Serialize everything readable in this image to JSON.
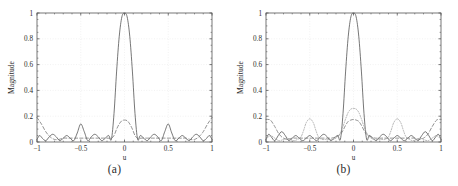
{
  "figure": {
    "panels": [
      {
        "id": "a",
        "caption": "(a)",
        "xlabel": "u",
        "ylabel": "Magnitude",
        "xticks": [
          "−1",
          "−0.5",
          "0",
          "0.5",
          "1"
        ],
        "yticks": [
          "0",
          "0.2",
          "0.4",
          "0.6",
          "0.8",
          "1"
        ]
      },
      {
        "id": "b",
        "caption": "(b)",
        "xlabel": "u",
        "ylabel": "Magnitude",
        "xticks": [
          "−1",
          "−0.5",
          "0",
          "0.5",
          "1"
        ],
        "yticks": [
          "0",
          "0.2",
          "0.4",
          "0.6",
          "0.8",
          "1"
        ]
      }
    ]
  },
  "colors": {
    "axis": "#555555",
    "curve_solid": "#4a4a4a",
    "curve_dashed": "#6f6f6f",
    "curve_dotted": "#9a9a9a",
    "grid": "#ededed",
    "background": "#ffffff"
  },
  "chart_data": [
    {
      "type": "line",
      "title": "(a)",
      "xlabel": "u",
      "ylabel": "Magnitude",
      "xlim": [
        -1,
        1
      ],
      "ylim": [
        0,
        1
      ],
      "xticks": [
        -1,
        -0.5,
        0,
        0.5,
        1
      ],
      "yticks": [
        0,
        0.2,
        0.4,
        0.6,
        0.8,
        1
      ],
      "grid": true,
      "legend": "none",
      "series": [
        {
          "name": "beampattern-solid",
          "style": "solid",
          "x": [
            -1.0,
            -0.97,
            -0.94,
            -0.9,
            -0.86,
            -0.82,
            -0.78,
            -0.74,
            -0.7,
            -0.66,
            -0.62,
            -0.58,
            -0.54,
            -0.5,
            -0.46,
            -0.42,
            -0.38,
            -0.34,
            -0.3,
            -0.26,
            -0.22,
            -0.18,
            -0.15,
            -0.12,
            -0.09,
            -0.06,
            -0.03,
            0.0,
            0.03,
            0.06,
            0.09,
            0.12,
            0.15,
            0.18,
            0.22,
            0.26,
            0.3,
            0.34,
            0.38,
            0.42,
            0.46,
            0.5,
            0.54,
            0.58,
            0.62,
            0.66,
            0.7,
            0.74,
            0.78,
            0.82,
            0.86,
            0.9,
            0.94,
            0.97,
            1.0
          ],
          "y": [
            0.02,
            0.05,
            0.03,
            0.01,
            0.04,
            0.06,
            0.04,
            0.01,
            0.03,
            0.05,
            0.03,
            0.01,
            0.07,
            0.14,
            0.08,
            0.01,
            0.04,
            0.06,
            0.04,
            0.01,
            0.03,
            0.05,
            0.02,
            0.22,
            0.55,
            0.82,
            0.97,
            1.0,
            0.97,
            0.82,
            0.55,
            0.22,
            0.02,
            0.05,
            0.03,
            0.01,
            0.04,
            0.06,
            0.04,
            0.01,
            0.08,
            0.14,
            0.07,
            0.01,
            0.03,
            0.05,
            0.03,
            0.01,
            0.04,
            0.06,
            0.04,
            0.01,
            0.03,
            0.05,
            0.02
          ]
        },
        {
          "name": "beampattern-dashed",
          "style": "dashed",
          "x": [
            -1.0,
            -0.95,
            -0.9,
            -0.85,
            -0.8,
            -0.75,
            -0.7,
            -0.65,
            -0.6,
            -0.55,
            -0.5,
            -0.45,
            -0.4,
            -0.35,
            -0.3,
            -0.25,
            -0.2,
            -0.15,
            -0.12,
            -0.09,
            -0.06,
            -0.03,
            0.0,
            0.03,
            0.06,
            0.09,
            0.12,
            0.15,
            0.2,
            0.25,
            0.3,
            0.35,
            0.4,
            0.45,
            0.5,
            0.55,
            0.6,
            0.65,
            0.7,
            0.75,
            0.8,
            0.85,
            0.9,
            0.95,
            1.0
          ],
          "y": [
            0.19,
            0.14,
            0.08,
            0.04,
            0.02,
            0.02,
            0.03,
            0.03,
            0.03,
            0.03,
            0.03,
            0.03,
            0.03,
            0.03,
            0.03,
            0.03,
            0.03,
            0.03,
            0.05,
            0.1,
            0.14,
            0.165,
            0.17,
            0.165,
            0.14,
            0.1,
            0.05,
            0.03,
            0.03,
            0.03,
            0.03,
            0.03,
            0.03,
            0.03,
            0.03,
            0.03,
            0.03,
            0.03,
            0.03,
            0.02,
            0.02,
            0.04,
            0.08,
            0.14,
            0.19
          ]
        }
      ]
    },
    {
      "type": "line",
      "title": "(b)",
      "xlabel": "u",
      "ylabel": "Magnitude",
      "xlim": [
        -1,
        1
      ],
      "ylim": [
        0,
        1
      ],
      "xticks": [
        -1,
        -0.5,
        0,
        0.5,
        1
      ],
      "yticks": [
        0,
        0.2,
        0.4,
        0.6,
        0.8,
        1
      ],
      "grid": true,
      "legend": "none",
      "series": [
        {
          "name": "beampattern-solid",
          "style": "solid",
          "x": [
            -1.0,
            -0.97,
            -0.94,
            -0.9,
            -0.86,
            -0.82,
            -0.78,
            -0.74,
            -0.7,
            -0.66,
            -0.62,
            -0.58,
            -0.54,
            -0.5,
            -0.46,
            -0.42,
            -0.38,
            -0.34,
            -0.3,
            -0.26,
            -0.22,
            -0.18,
            -0.15,
            -0.12,
            -0.09,
            -0.06,
            -0.03,
            0.0,
            0.03,
            0.06,
            0.09,
            0.12,
            0.15,
            0.18,
            0.22,
            0.26,
            0.3,
            0.34,
            0.38,
            0.42,
            0.46,
            0.5,
            0.54,
            0.58,
            0.62,
            0.66,
            0.7,
            0.74,
            0.78,
            0.82,
            0.86,
            0.9,
            0.94,
            0.97,
            1.0
          ],
          "y": [
            0.02,
            0.06,
            0.04,
            0.01,
            0.05,
            0.08,
            0.05,
            0.01,
            0.03,
            0.05,
            0.03,
            0.01,
            0.03,
            0.05,
            0.03,
            0.01,
            0.04,
            0.06,
            0.04,
            0.01,
            0.03,
            0.05,
            0.02,
            0.22,
            0.55,
            0.82,
            0.97,
            1.0,
            0.97,
            0.82,
            0.55,
            0.22,
            0.02,
            0.05,
            0.03,
            0.01,
            0.04,
            0.06,
            0.04,
            0.01,
            0.03,
            0.05,
            0.03,
            0.01,
            0.03,
            0.05,
            0.03,
            0.01,
            0.05,
            0.08,
            0.05,
            0.01,
            0.04,
            0.06,
            0.02
          ]
        },
        {
          "name": "beampattern-dashed",
          "style": "dashed",
          "x": [
            -1.0,
            -0.95,
            -0.9,
            -0.85,
            -0.8,
            -0.75,
            -0.7,
            -0.65,
            -0.6,
            -0.55,
            -0.5,
            -0.45,
            -0.4,
            -0.35,
            -0.3,
            -0.25,
            -0.2,
            -0.15,
            -0.12,
            -0.09,
            -0.06,
            -0.03,
            0.0,
            0.03,
            0.06,
            0.09,
            0.12,
            0.15,
            0.2,
            0.25,
            0.3,
            0.35,
            0.4,
            0.45,
            0.5,
            0.55,
            0.6,
            0.65,
            0.7,
            0.75,
            0.8,
            0.85,
            0.9,
            0.95,
            1.0
          ],
          "y": [
            0.175,
            0.17,
            0.12,
            0.06,
            0.03,
            0.02,
            0.03,
            0.03,
            0.03,
            0.03,
            0.03,
            0.03,
            0.03,
            0.03,
            0.03,
            0.03,
            0.04,
            0.06,
            0.09,
            0.13,
            0.16,
            0.17,
            0.175,
            0.17,
            0.16,
            0.13,
            0.09,
            0.06,
            0.04,
            0.03,
            0.03,
            0.03,
            0.03,
            0.03,
            0.03,
            0.03,
            0.03,
            0.03,
            0.03,
            0.02,
            0.03,
            0.06,
            0.12,
            0.17,
            0.175
          ]
        },
        {
          "name": "beampattern-dotted",
          "style": "dotted",
          "x": [
            -1.0,
            -0.95,
            -0.9,
            -0.85,
            -0.8,
            -0.76,
            -0.72,
            -0.68,
            -0.64,
            -0.6,
            -0.57,
            -0.54,
            -0.5,
            -0.46,
            -0.43,
            -0.4,
            -0.36,
            -0.32,
            -0.28,
            -0.24,
            -0.2,
            -0.16,
            -0.12,
            -0.09,
            -0.06,
            -0.03,
            0.0,
            0.03,
            0.06,
            0.09,
            0.12,
            0.16,
            0.2,
            0.24,
            0.28,
            0.32,
            0.36,
            0.4,
            0.43,
            0.46,
            0.5,
            0.54,
            0.57,
            0.6,
            0.64,
            0.68,
            0.72,
            0.76,
            0.8,
            0.85,
            0.9,
            0.95,
            1.0
          ],
          "y": [
            0.02,
            0.05,
            0.03,
            0.01,
            0.02,
            0.03,
            0.02,
            0.01,
            0.02,
            0.04,
            0.09,
            0.15,
            0.18,
            0.15,
            0.09,
            0.04,
            0.02,
            0.02,
            0.02,
            0.02,
            0.03,
            0.06,
            0.12,
            0.18,
            0.23,
            0.255,
            0.26,
            0.255,
            0.23,
            0.18,
            0.12,
            0.06,
            0.03,
            0.02,
            0.02,
            0.02,
            0.02,
            0.04,
            0.09,
            0.15,
            0.18,
            0.15,
            0.09,
            0.04,
            0.02,
            0.01,
            0.02,
            0.03,
            0.02,
            0.01,
            0.03,
            0.05,
            0.02
          ]
        }
      ]
    }
  ]
}
